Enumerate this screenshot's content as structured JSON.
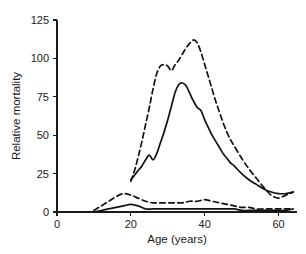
{
  "chart_data": {
    "type": "line",
    "title": "",
    "xlabel": "Age (years)",
    "ylabel": "Relative mortality",
    "xlim": [
      0,
      65
    ],
    "ylim": [
      0,
      125
    ],
    "xticks": [
      0,
      20,
      40,
      60
    ],
    "yticks": [
      0,
      25,
      50,
      75,
      100,
      125
    ],
    "xtick_labels": [
      "0",
      "20",
      "40",
      "60"
    ],
    "ytick_labels": [
      "0",
      "25",
      "50",
      "75",
      "100",
      "125"
    ],
    "grid": false,
    "legend": "none",
    "series": [
      {
        "name": "upper-dashed",
        "style": "dashed",
        "x": [
          20,
          21,
          22,
          23,
          24,
          25,
          26,
          27,
          28,
          29,
          30,
          31,
          32,
          33,
          34,
          35,
          36,
          37,
          38,
          39,
          40,
          41,
          42,
          43,
          44,
          45,
          46,
          47,
          48,
          50,
          52,
          54,
          56,
          58,
          60,
          62,
          64
        ],
        "values": [
          20,
          27,
          36,
          46,
          57,
          68,
          80,
          90,
          95,
          96,
          95,
          92,
          96,
          99,
          103,
          107,
          110,
          112,
          110,
          104,
          96,
          88,
          80,
          72,
          65,
          58,
          52,
          47,
          43,
          35,
          28,
          22,
          16,
          11,
          9,
          11,
          13
        ]
      },
      {
        "name": "upper-solid",
        "style": "solid",
        "x": [
          20,
          21,
          22,
          23,
          24,
          25,
          26,
          27,
          28,
          29,
          30,
          31,
          32,
          33,
          34,
          35,
          36,
          37,
          38,
          39,
          40,
          41,
          42,
          43,
          44,
          45,
          46,
          47,
          48,
          50,
          52,
          54,
          56,
          58,
          60,
          62,
          64
        ],
        "values": [
          21,
          24,
          27,
          30,
          34,
          37,
          34,
          38,
          45,
          52,
          60,
          69,
          78,
          83,
          84,
          82,
          77,
          72,
          68,
          66,
          60,
          55,
          50,
          46,
          42,
          38,
          35,
          32,
          30,
          25,
          21,
          18,
          15,
          13,
          12,
          12,
          13
        ]
      },
      {
        "name": "lower-dashed",
        "style": "dashed",
        "x": [
          10,
          12,
          14,
          16,
          18,
          20,
          22,
          24,
          26,
          28,
          30,
          32,
          34,
          36,
          38,
          40,
          42,
          44,
          46,
          48,
          50,
          52,
          54,
          56,
          58,
          60,
          62,
          64
        ],
        "values": [
          1,
          4,
          7,
          10,
          12,
          11,
          9,
          7,
          6,
          6,
          6,
          6,
          6,
          7,
          7,
          8,
          7,
          6,
          5,
          4,
          3,
          3,
          2,
          2,
          2,
          2,
          2,
          2
        ]
      },
      {
        "name": "lower-solid",
        "style": "solid",
        "x": [
          10,
          12,
          14,
          16,
          18,
          20,
          22,
          24,
          26,
          28,
          30,
          32,
          34,
          36,
          38,
          40,
          42,
          44,
          46,
          48,
          50,
          52,
          54,
          56,
          58,
          60,
          62,
          64
        ],
        "values": [
          0,
          1,
          2,
          3,
          4,
          5,
          4,
          2,
          2,
          2,
          2,
          2,
          2,
          2,
          2,
          2,
          2,
          2,
          2,
          2,
          1,
          1,
          1,
          1,
          1,
          1,
          1,
          2
        ]
      }
    ],
    "colors": {
      "line": "#121212",
      "axis": "#1a1a1a",
      "background": "#ffffff"
    }
  }
}
